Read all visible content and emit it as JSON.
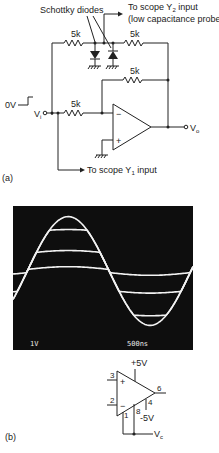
{
  "figure_a": {
    "label": "(a)",
    "schottky_label": "Schottky diodes",
    "y2_label": "To scope Y",
    "y2_sub": "2",
    "y2_suffix": " input",
    "y2_note": "(low capacitance probe)",
    "r1": "5k",
    "r2": "5k",
    "r3": "5k",
    "r4": "5k",
    "input_step": "0V",
    "vi": "V",
    "vi_sub": "i",
    "vo": "V",
    "vo_sub": "o",
    "opamp_minus": "−",
    "opamp_plus": "+",
    "y1_label": "To scope Y",
    "y1_sub": "1",
    "y1_suffix": " input"
  },
  "scope": {
    "volts_div": "1V",
    "time_div": "500ns",
    "traces": [
      {
        "name": "input",
        "amplitude_divs": 3.2,
        "clip_pos": null,
        "clip_neg": null
      },
      {
        "name": "clamped-1",
        "clip_pos": 2.4,
        "clip_neg": -2.6
      },
      {
        "name": "clamped-2",
        "clip_pos": 1.1,
        "clip_neg": -1.2
      },
      {
        "name": "clamped-3",
        "clip_pos": 0.1,
        "clip_neg": -0.1
      }
    ]
  },
  "figure_b": {
    "label": "(b)",
    "vplus": "+5V",
    "vminus": "-5V",
    "pin3": "3",
    "pin2": "2",
    "pin6": "6",
    "pin4": "4",
    "pin8": "8",
    "pin1": "1",
    "plus": "+",
    "minus": "−",
    "vc": "V",
    "vc_sub": "c"
  }
}
